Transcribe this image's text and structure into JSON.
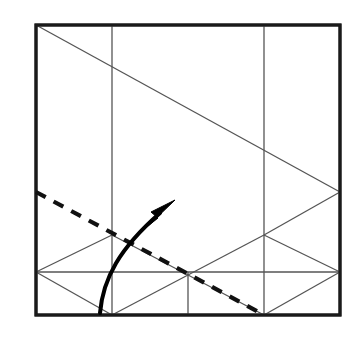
{
  "figure": {
    "kind": "origami-crease-pattern-diagram",
    "canvas": {
      "width": 359,
      "height": 337,
      "background": "#ffffff"
    },
    "colors": {
      "sheet_fill": "#ffffff",
      "border": "#1a1a1a",
      "crease_line": "#555555",
      "valley_fold_dashed": "#111111",
      "arrow": "#000000"
    },
    "stroke_widths": {
      "border": 3.0,
      "crease_line": 1.3,
      "valley_fold_dashed": 4.2,
      "arrow": 4.0
    },
    "dash_pattern": "11 9"
  },
  "sheet": {
    "label": "paper-square",
    "left": 36,
    "top": 25,
    "right": 340,
    "bottom": 315,
    "width": 304,
    "height": 290,
    "points": "36,25 340,25 340,315 36,315"
  },
  "creases": [
    {
      "name": "vertical-crease-left",
      "type": "mountain",
      "x1": 112,
      "y1": 25,
      "x2": 112,
      "y2": 315
    },
    {
      "name": "vertical-crease-right",
      "type": "mountain",
      "x1": 264,
      "y1": 25,
      "x2": 264,
      "y2": 315
    },
    {
      "name": "vertical-crease-mid-short",
      "type": "mountain",
      "x1": 188,
      "y1": 272,
      "x2": 188,
      "y2": 315
    },
    {
      "name": "main-diagonal-top",
      "type": "mountain",
      "x1": 36,
      "y1": 25,
      "x2": 340,
      "y2": 192
    },
    {
      "name": "right-zigzag-up",
      "type": "mountain",
      "x1": 340,
      "y1": 192,
      "x2": 264,
      "y2": 235
    },
    {
      "name": "right-zigzag-down",
      "type": "mountain",
      "x1": 264,
      "y1": 235,
      "x2": 340,
      "y2": 272
    },
    {
      "name": "right-lower-zigzag-down",
      "type": "mountain",
      "x1": 340,
      "y1": 272,
      "x2": 264,
      "y2": 315
    },
    {
      "name": "band-diagonal-upper-left",
      "type": "mountain",
      "x1": 36,
      "y1": 272,
      "x2": 112,
      "y2": 235
    },
    {
      "name": "band-diagonal-upper-right",
      "type": "mountain",
      "x1": 112,
      "y1": 235,
      "x2": 264,
      "y2": 315
    },
    {
      "name": "band-diagonal-lower-left",
      "type": "mountain",
      "x1": 36,
      "y1": 272,
      "x2": 112,
      "y2": 315
    },
    {
      "name": "band-horizontal",
      "type": "mountain",
      "x1": 36,
      "y1": 272,
      "x2": 340,
      "y2": 272
    },
    {
      "name": "band-diagonal-rise",
      "type": "mountain",
      "x1": 112,
      "y1": 315,
      "x2": 264,
      "y2": 235
    }
  ],
  "valley_fold": {
    "name": "valley-fold-dashed-line",
    "type": "valley",
    "style": "dashed",
    "x1": 36,
    "y1": 192,
    "x2": 264,
    "y2": 315
  },
  "fold_arrow": {
    "name": "fold-direction-arrow",
    "description": "curved arrow indicating fold up and to the right",
    "path": "M 100,313 C 103,278 120,248 160,213",
    "tip": {
      "x": 175,
      "y": 200
    },
    "head_points": "175,200 151,212 158,218 148,226"
  }
}
